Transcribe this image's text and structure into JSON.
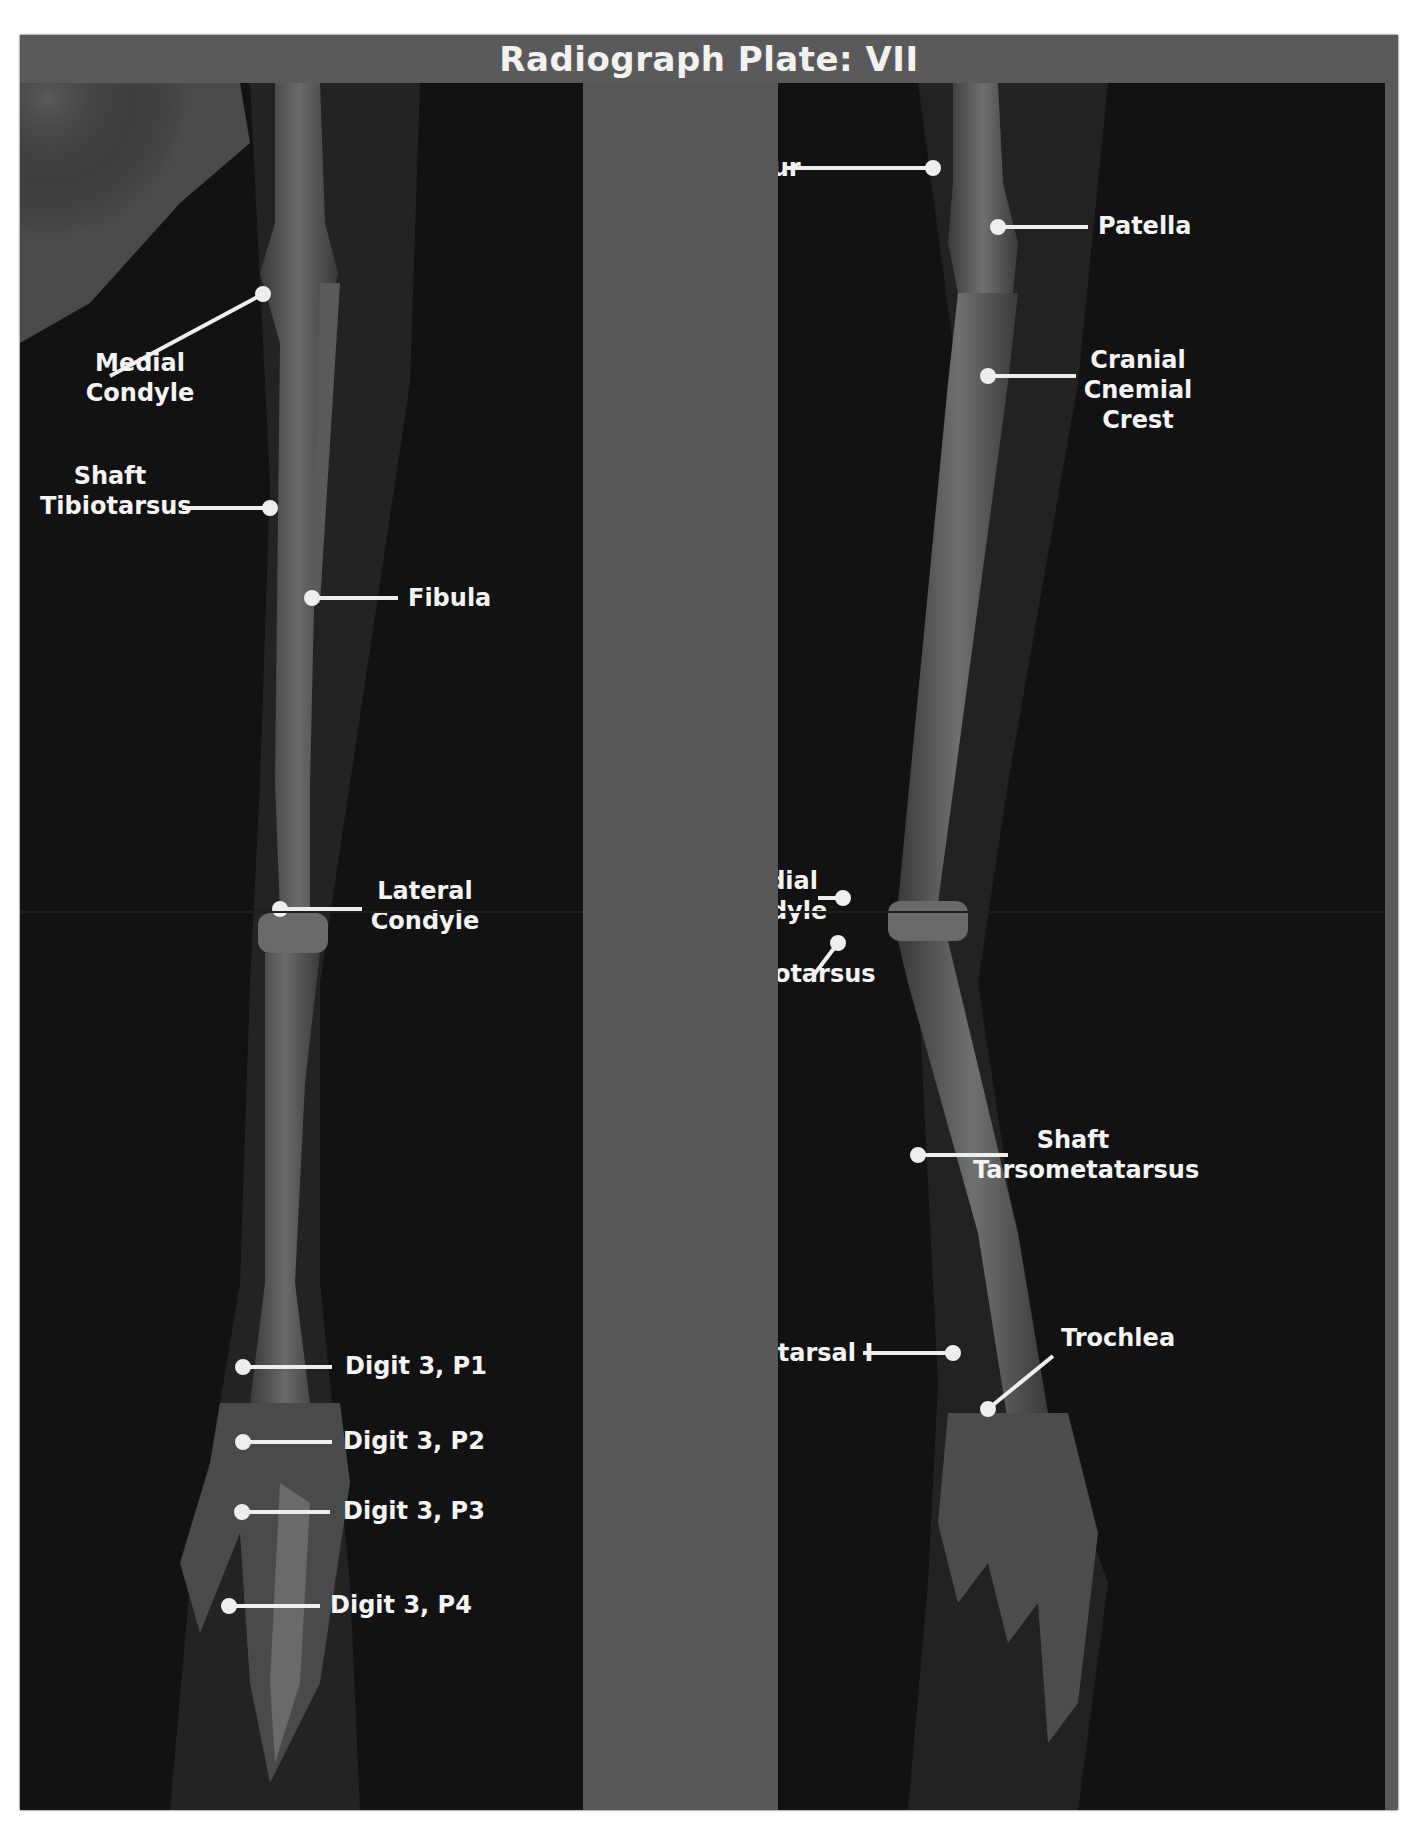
{
  "plate": {
    "title": "Radiograph Plate: VII",
    "colors": {
      "frame": "#5a5a5a",
      "panel_dark": "#121212",
      "center_strip": "#575757",
      "label_text": "#f4f4f4",
      "leader_line": "#eeeeee"
    }
  },
  "left_panel": {
    "labels": [
      {
        "id": "medial-condyle",
        "lines": [
          "Medial",
          "Condyle"
        ]
      },
      {
        "id": "shaft-tibiotarsus",
        "lines": [
          "Shaft",
          "Tibiotarsus"
        ]
      },
      {
        "id": "fibula",
        "lines": [
          "Fibula"
        ]
      },
      {
        "id": "lateral-condyle",
        "lines": [
          "Lateral",
          "Condyle"
        ]
      },
      {
        "id": "digit3-p1",
        "lines": [
          "Digit 3, P1"
        ]
      },
      {
        "id": "digit3-p2",
        "lines": [
          "Digit 3, P2"
        ]
      },
      {
        "id": "digit3-p3",
        "lines": [
          "Digit 3, P3"
        ]
      },
      {
        "id": "digit3-p4",
        "lines": [
          "Digit 3, P4"
        ]
      }
    ]
  },
  "right_panel": {
    "labels": [
      {
        "id": "femur",
        "lines": [
          "Femur"
        ]
      },
      {
        "id": "patella",
        "lines": [
          "Patella"
        ]
      },
      {
        "id": "cranial-cnemial-crest",
        "lines": [
          "Cranial",
          "Cnemial",
          "Crest"
        ]
      },
      {
        "id": "medial-condyle",
        "lines": [
          "Medial",
          "Condyle"
        ]
      },
      {
        "id": "hypotarsus",
        "lines": [
          "Hypotarsus"
        ]
      },
      {
        "id": "shaft-tarsometatarsus",
        "lines": [
          "Shaft",
          "Tarsometatarsus"
        ]
      },
      {
        "id": "metatarsal-i",
        "lines": [
          "Metatarsal I"
        ]
      },
      {
        "id": "trochlea",
        "lines": [
          "Trochlea"
        ]
      }
    ]
  }
}
